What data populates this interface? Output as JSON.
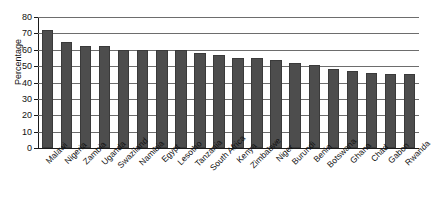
{
  "chart_data": {
    "type": "bar",
    "title": "",
    "subtitle": "",
    "xlabel": "",
    "ylabel": "Percentage",
    "ylim": [
      0,
      80
    ],
    "yticks": [
      0,
      10,
      20,
      30,
      40,
      50,
      60,
      70,
      80
    ],
    "grid": true,
    "legend": null,
    "bar_color": "#4d4d4d",
    "categories": [
      "Malawi",
      "Nigeria",
      "Zambia",
      "Uganda",
      "Swaziland",
      "Namibia",
      "Egypt",
      "Lesotho",
      "Tanzania",
      "South Africa",
      "Kenya",
      "Zimbabwe",
      "Niger",
      "Burundi",
      "Benin",
      "Botswana",
      "Ghana",
      "Chad",
      "Gabon",
      "Rwanda"
    ],
    "values": [
      72,
      65,
      62,
      62,
      60,
      60,
      60,
      60,
      58,
      57,
      55,
      55,
      54,
      52,
      51,
      48,
      47,
      46,
      45,
      45
    ]
  },
  "axis": {
    "y_title": "Percentage"
  }
}
